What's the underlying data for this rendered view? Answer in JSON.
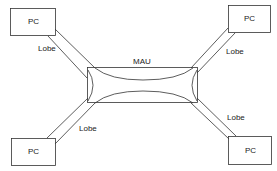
{
  "diagram": {
    "hub": {
      "label": "MAU"
    },
    "nodes": [
      {
        "id": "pc-top-left",
        "label": "PC"
      },
      {
        "id": "pc-top-right",
        "label": "PC"
      },
      {
        "id": "pc-bottom-left",
        "label": "PC"
      },
      {
        "id": "pc-bottom-right",
        "label": "PC"
      }
    ],
    "links": [
      {
        "from": "pc-top-left",
        "to": "MAU",
        "label": "Lobe"
      },
      {
        "from": "pc-top-right",
        "to": "MAU",
        "label": "Lobe"
      },
      {
        "from": "pc-bottom-left",
        "to": "MAU",
        "label": "Lobe"
      },
      {
        "from": "pc-bottom-right",
        "to": "MAU",
        "label": "Lobe"
      }
    ],
    "colors": {
      "stroke": "#333333",
      "background": "#ffffff"
    }
  }
}
